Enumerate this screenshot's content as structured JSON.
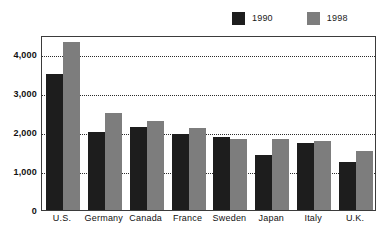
{
  "chart_data": {
    "type": "bar",
    "title": "",
    "subtitle": "",
    "xlabel": "",
    "ylabel": "",
    "categories": [
      "U.S.",
      "Germany",
      "Canada",
      "France",
      "Sweden",
      "Japan",
      "Italy",
      "U.K."
    ],
    "series": [
      {
        "name": "1990",
        "color": "#1d1d1d",
        "values": [
          3500,
          2010,
          2130,
          1950,
          1880,
          1420,
          1720,
          1230
        ]
      },
      {
        "name": "1998",
        "color": "#7d7d7d",
        "values": [
          4320,
          2500,
          2280,
          2120,
          1820,
          1830,
          1780,
          1520
        ]
      }
    ],
    "ylim": [
      0,
      4500
    ],
    "yticks": [
      0,
      1000,
      2000,
      3000,
      4000
    ],
    "ytick_labels": [
      "0",
      "1,000",
      "2,000",
      "3,000",
      "4,000"
    ],
    "grid": true,
    "grid_style": "dotted-horizontal",
    "legend_position": "top-right",
    "frame": true
  },
  "legend": {
    "entries": [
      {
        "label": "1990",
        "color": "#1d1d1d"
      },
      {
        "label": "1998",
        "color": "#7d7d7d"
      }
    ]
  },
  "colors": {
    "series_1990": "#1d1d1d",
    "series_1998": "#7d7d7d",
    "frame": "#3b3b3b",
    "grid": "#2b2b2b",
    "text": "#111111",
    "background": "#ffffff"
  }
}
